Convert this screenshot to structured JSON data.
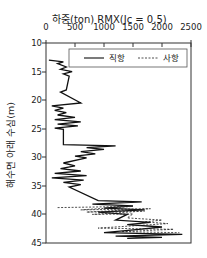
{
  "chart_data": {
    "type": "line",
    "title": "하중(ton) RMX(Jc = 0.5)",
    "xlabel": "하중(ton) RMX(Jc = 0.5)",
    "ylabel": "해수면 아래 수심(m)",
    "x_ticks": [
      "0",
      "500",
      "1000",
      "1500",
      "2000",
      "2500"
    ],
    "y_ticks": [
      "10",
      "15",
      "20",
      "25",
      "30",
      "35",
      "40",
      "45"
    ],
    "xlim": [
      0,
      2500
    ],
    "ylim": [
      45,
      10
    ],
    "y_inverted": true,
    "x_axis_position": "top",
    "grid": false,
    "legend_position": "top inside",
    "series": [
      {
        "name": "직항",
        "style": "solid",
        "points": [
          [
            50,
            13.0
          ],
          [
            300,
            13.3
          ],
          [
            200,
            13.6
          ],
          [
            350,
            14.2
          ],
          [
            250,
            14.6
          ],
          [
            450,
            15.0
          ],
          [
            300,
            15.4
          ],
          [
            400,
            15.8
          ],
          [
            350,
            18.2
          ],
          [
            250,
            18.6
          ],
          [
            600,
            20.5
          ],
          [
            100,
            21.0
          ],
          [
            300,
            21.4
          ],
          [
            150,
            21.8
          ],
          [
            350,
            22.2
          ],
          [
            200,
            22.6
          ],
          [
            500,
            23.0
          ],
          [
            150,
            23.4
          ],
          [
            600,
            23.8
          ],
          [
            200,
            24.2
          ],
          [
            550,
            24.5
          ],
          [
            150,
            24.9
          ],
          [
            300,
            25.1
          ],
          [
            300,
            27.8
          ],
          [
            1200,
            28.0
          ],
          [
            700,
            28.3
          ],
          [
            1000,
            28.6
          ],
          [
            600,
            29.0
          ],
          [
            850,
            29.4
          ],
          [
            500,
            29.8
          ],
          [
            700,
            30.1
          ],
          [
            300,
            31.0
          ],
          [
            500,
            31.5
          ],
          [
            250,
            32.0
          ],
          [
            600,
            32.4
          ],
          [
            150,
            32.8
          ],
          [
            700,
            33.2
          ],
          [
            100,
            33.6
          ],
          [
            650,
            34.0
          ],
          [
            300,
            34.4
          ],
          [
            600,
            34.8
          ],
          [
            400,
            35.2
          ],
          [
            900,
            37.6
          ],
          [
            1650,
            37.8
          ],
          [
            800,
            38.2
          ],
          [
            1500,
            38.5
          ],
          [
            1000,
            38.9
          ],
          [
            1700,
            39.2
          ],
          [
            900,
            39.6
          ],
          [
            1400,
            40.0
          ],
          [
            1200,
            41.0
          ],
          [
            1800,
            41.4
          ],
          [
            1400,
            41.8
          ],
          [
            2000,
            42.2
          ],
          [
            1600,
            42.6
          ],
          [
            1000,
            43.2
          ],
          [
            2350,
            43.5
          ],
          [
            1200,
            43.8
          ],
          [
            2000,
            44.0
          ],
          [
            1400,
            44.2
          ]
        ]
      },
      {
        "name": "사항",
        "style": "dashed",
        "points": [
          [
            200,
            38.8
          ],
          [
            1500,
            38.6
          ],
          [
            600,
            39.2
          ],
          [
            1800,
            39.0
          ],
          [
            700,
            39.6
          ],
          [
            1700,
            39.4
          ],
          [
            800,
            40.0
          ],
          [
            1500,
            39.9
          ],
          [
            1400,
            40.6
          ],
          [
            2000,
            41.0
          ],
          [
            1700,
            41.3
          ],
          [
            2100,
            41.6
          ],
          [
            900,
            42.4
          ],
          [
            2200,
            42.6
          ],
          [
            1300,
            43.0
          ],
          [
            2300,
            43.2
          ]
        ]
      }
    ]
  },
  "legend": {
    "solid_label": "직항",
    "dashed_label": "사항"
  }
}
